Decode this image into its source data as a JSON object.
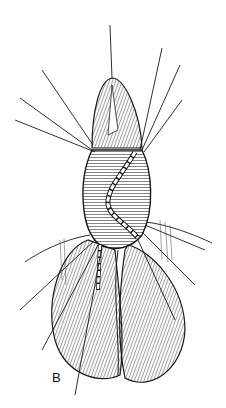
{
  "figure": {
    "panel_label": "B",
    "colors": {
      "ink": "#1a1a1a",
      "background": "#ffffff"
    }
  }
}
